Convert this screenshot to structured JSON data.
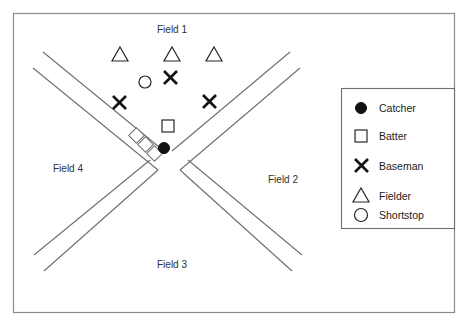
{
  "diagram": {
    "background_color": "#ffffff",
    "border_color": "#8a8a8a",
    "line_color": "#6e6e6e",
    "symbol_color": "#111111"
  },
  "fields": {
    "field_1": "Field 1",
    "field_2": "Field 2",
    "field_3": "Field 3",
    "field_4": "Field 4"
  },
  "legend": {
    "items": [
      {
        "icon": "filled-circle-icon",
        "label": "Catcher"
      },
      {
        "icon": "open-square-icon",
        "label": "Batter"
      },
      {
        "icon": "x-cross-icon",
        "label": "Baseman"
      },
      {
        "icon": "open-triangle-icon",
        "label": "Fielder"
      },
      {
        "icon": "open-circle-icon",
        "label": "Shortstop"
      }
    ]
  },
  "players": {
    "fielders": [
      {
        "role": "Fielder",
        "icon": "open-triangle-icon",
        "x": 120,
        "y": 55
      },
      {
        "role": "Fielder",
        "icon": "open-triangle-icon",
        "x": 172,
        "y": 55
      },
      {
        "role": "Fielder",
        "icon": "open-triangle-icon",
        "x": 214,
        "y": 55
      }
    ],
    "shortstop": {
      "role": "Shortstop",
      "icon": "open-circle-icon",
      "x": 145,
      "y": 82
    },
    "basemen": [
      {
        "role": "Baseman",
        "icon": "x-cross-icon",
        "x": 170,
        "y": 77
      },
      {
        "role": "Baseman",
        "icon": "x-cross-icon",
        "x": 119,
        "y": 102
      },
      {
        "role": "Baseman",
        "icon": "x-cross-icon",
        "x": 209,
        "y": 101
      }
    ],
    "batter": {
      "role": "Batter",
      "icon": "open-square-icon",
      "x": 168,
      "y": 126
    },
    "catcher": {
      "role": "Catcher",
      "icon": "filled-circle-icon",
      "x": 164,
      "y": 148
    }
  },
  "on_deck_boxes": [
    {
      "x": 137,
      "y": 136
    },
    {
      "x": 146,
      "y": 145
    },
    {
      "x": 155,
      "y": 154
    }
  ]
}
